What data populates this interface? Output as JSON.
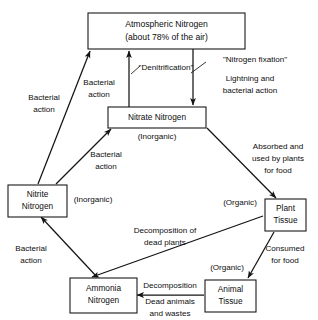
{
  "diagram": {
    "type": "cycle-flow-diagram",
    "nodes": {
      "atmospheric": {
        "line1": "Atmospheric Nitrogen",
        "line2": "(about 78% of the air)"
      },
      "nitrate": {
        "line1": "Nitrate Nitrogen",
        "state": "(Inorganic)"
      },
      "nitrite": {
        "line1": "Nitrite",
        "line2": "Nitrogen",
        "state": "(Inorganic)"
      },
      "ammonia": {
        "line1": "Ammonia",
        "line2": "Nitrogen"
      },
      "plant_tissue": {
        "line1": "Plant",
        "line2": "Tissue",
        "state": "(Organic)"
      },
      "animal_tissue": {
        "line1": "Animal",
        "line2": "Tissue",
        "state": "(Organic)"
      }
    },
    "edge_labels": {
      "nitrite_to_atmospheric": {
        "line1": "Bacterial",
        "line2": "action"
      },
      "nitrate_to_atmospheric_process": "\"Denitrification\"",
      "nitrate_to_atmospheric": {
        "line1": "Bacterial",
        "line2": "action"
      },
      "atmospheric_to_nitrate_process": "\"Nitrogen fixation\"",
      "atmospheric_to_nitrate": {
        "line1": "Lightning and",
        "line2": "bacterial action"
      },
      "nitrite_to_nitrate": {
        "line1": "Bacterial",
        "line2": "action"
      },
      "ammonia_to_nitrite": {
        "line1": "Bacterial",
        "line2": "action"
      },
      "nitrate_to_plant": {
        "line1": "Absorbed and",
        "line2": "used by plants",
        "line3": "for food"
      },
      "plant_to_animal": {
        "line1": "Consumed",
        "line2": "for food"
      },
      "plant_to_ammonia": {
        "line1": "Decomposition of",
        "line2": "dead plants"
      },
      "animal_to_ammonia": {
        "line1": "Decomposition",
        "line2": "Dead animals",
        "line3": "and wastes"
      }
    }
  }
}
